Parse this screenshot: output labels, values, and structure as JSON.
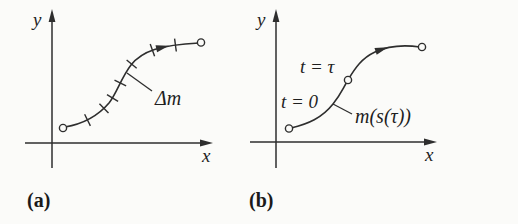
{
  "figure": {
    "background_color": "#fbfbf9",
    "ink_color": "#2e2e2e",
    "panel_a": {
      "tag": "(a)",
      "y_axis_label": "y",
      "x_axis_label": "x",
      "segment_annotation": "Δm"
    },
    "panel_b": {
      "tag": "(b)",
      "y_axis_label": "y",
      "x_axis_label": "x",
      "start_time_label": "t = 0",
      "tau_time_label": "t = τ",
      "position_function_label": "m(s(τ))"
    }
  }
}
